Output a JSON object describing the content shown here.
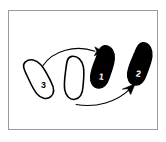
{
  "figure": {
    "panel": {
      "background_color": "#ffffff",
      "border_color": "#9a9a9a"
    },
    "stroke_color": "#000000",
    "fill_outline_color": "#ffffff",
    "fill_solid_color": "#000000",
    "shapes": [
      {
        "id": "shape-outline-left",
        "style": "outline",
        "label": "3",
        "label_color": "#000000",
        "description": "tilted teardrop outline, lower left",
        "cx": 38,
        "cy": 79,
        "rotation": -38
      },
      {
        "id": "shape-outline-middle",
        "style": "outline",
        "label": "",
        "label_color": "#000000",
        "description": "upright teardrop outline, center",
        "cx": 74,
        "cy": 78,
        "rotation": -6
      },
      {
        "id": "shape-solid-third",
        "style": "solid",
        "label": "1",
        "label_color": "#ffffff",
        "description": "solid black teardrop, third position",
        "cx": 103,
        "cy": 67,
        "rotation": 8
      },
      {
        "id": "shape-solid-fourth",
        "style": "solid",
        "label": "2",
        "label_color": "#ffffff",
        "description": "solid black teardrop, right",
        "cx": 141,
        "cy": 64,
        "rotation": 10
      }
    ],
    "arrows": [
      {
        "id": "arrow-upper",
        "description": "curved arrow from left outline shape to third solid shape",
        "from_shape": "shape-outline-left",
        "to_shape": "shape-solid-third",
        "direction": "right"
      },
      {
        "id": "arrow-lower",
        "description": "curved arrow from middle outline shape to right solid shape",
        "from_shape": "shape-outline-middle",
        "to_shape": "shape-solid-fourth",
        "direction": "up-right"
      }
    ]
  }
}
